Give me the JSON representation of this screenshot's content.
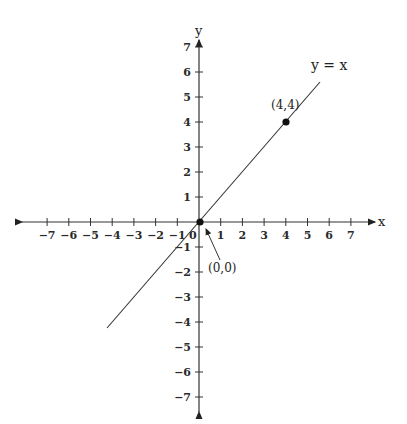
{
  "chart_data": {
    "type": "line",
    "title": "",
    "xlabel": "x",
    "ylabel": "y",
    "xlim": [
      -7,
      7
    ],
    "ylim": [
      -7,
      7
    ],
    "grid": false,
    "x_ticks": [
      -7,
      -6,
      -5,
      -4,
      -3,
      -2,
      -1,
      0,
      1,
      2,
      3,
      4,
      5,
      6,
      7
    ],
    "y_ticks": [
      -7,
      -6,
      -5,
      -4,
      -3,
      -2,
      -1,
      1,
      2,
      3,
      4,
      5,
      6,
      7
    ],
    "x_tick_labels": [
      "−7",
      "−6",
      "−5",
      "−4",
      "−3",
      "−2",
      "−1",
      "0",
      "1",
      "2",
      "3",
      "4",
      "5",
      "6",
      "7"
    ],
    "y_tick_labels": [
      "−7",
      "−6",
      "−5",
      "−4",
      "−3",
      "−2",
      "−1",
      "1",
      "2",
      "3",
      "4",
      "5",
      "6",
      "7"
    ],
    "series": [
      {
        "name": "y = x",
        "x": [
          -4.3,
          5.6
        ],
        "y": [
          -4.3,
          5.6
        ]
      }
    ],
    "points": [
      {
        "x": 0,
        "y": 0,
        "label": "(0,0)"
      },
      {
        "x": 4,
        "y": 4,
        "label": "(4,4)"
      }
    ],
    "annotations": [
      "y = x",
      "(4,4)",
      "(0,0)"
    ]
  },
  "labels": {
    "x_axis": "x",
    "y_axis": "y",
    "line": "y = x",
    "point_a": "(4,4)",
    "point_origin": "(0,0)",
    "origin_tick": "0"
  },
  "colors": {
    "ink": "#222222",
    "background": "#ffffff"
  }
}
